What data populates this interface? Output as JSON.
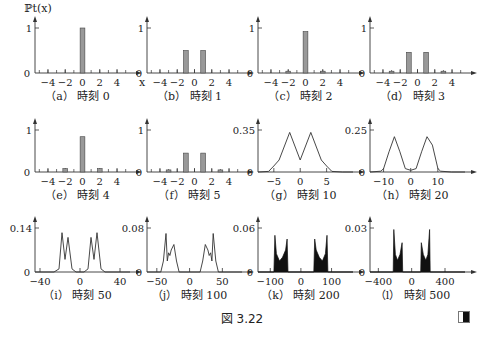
{
  "figure": {
    "label": "図 3.22",
    "y_axis_label": "ℙt(x)",
    "x_axis_label": "x"
  },
  "chart_data": [
    {
      "id": "a",
      "type": "bar",
      "caption": "（a） 時刻 0",
      "time": 0,
      "xlim": [
        -5.5,
        5.5
      ],
      "ylim": [
        0,
        1
      ],
      "yticks": [
        "0",
        "1"
      ],
      "xticks": [
        -4,
        -2,
        0,
        2,
        4
      ],
      "x": [
        -4,
        -3,
        -2,
        -1,
        0,
        1,
        2,
        3,
        4
      ],
      "values": [
        0,
        0,
        0,
        0,
        1,
        0,
        0,
        0,
        0
      ]
    },
    {
      "id": "b",
      "type": "bar",
      "caption": "（b） 時刻 1",
      "time": 1,
      "xlim": [
        -5.5,
        5.5
      ],
      "ylim": [
        0,
        1
      ],
      "yticks": [
        "0",
        "1"
      ],
      "xticks": [
        -4,
        -2,
        0,
        2,
        4
      ],
      "x": [
        -4,
        -3,
        -2,
        -1,
        0,
        1,
        2,
        3,
        4
      ],
      "values": [
        0,
        0,
        0,
        0.5,
        0,
        0.5,
        0,
        0,
        0
      ]
    },
    {
      "id": "c",
      "type": "bar",
      "caption": "（c） 時刻 2",
      "time": 2,
      "xlim": [
        -5.5,
        5.5
      ],
      "ylim": [
        0,
        1
      ],
      "yticks": [
        "0",
        "1"
      ],
      "xticks": [
        -4,
        -2,
        0,
        2,
        4
      ],
      "x": [
        -4,
        -3,
        -2,
        -1,
        0,
        1,
        2,
        3,
        4
      ],
      "values": [
        0,
        0,
        0.04,
        0,
        0.92,
        0,
        0.04,
        0,
        0
      ]
    },
    {
      "id": "d",
      "type": "bar",
      "caption": "（d） 時刻 3",
      "time": 3,
      "xlim": [
        -5.5,
        5.5
      ],
      "ylim": [
        0,
        1
      ],
      "yticks": [
        "0",
        "1"
      ],
      "xticks": [
        -4,
        -2,
        0,
        2,
        4
      ],
      "x": [
        -4,
        -3,
        -2,
        -1,
        0,
        1,
        2,
        3,
        4
      ],
      "values": [
        0,
        0.04,
        0,
        0.46,
        0,
        0.46,
        0,
        0.04,
        0
      ]
    },
    {
      "id": "e",
      "type": "bar",
      "caption": "（e） 時刻 4",
      "time": 4,
      "xlim": [
        -5.5,
        5.5
      ],
      "ylim": [
        0,
        1
      ],
      "yticks": [
        "0",
        "1"
      ],
      "xticks": [
        -4,
        -2,
        0,
        2,
        4
      ],
      "x": [
        -4,
        -3,
        -2,
        -1,
        0,
        1,
        2,
        3,
        4
      ],
      "values": [
        0,
        0,
        0.08,
        0,
        0.84,
        0,
        0.08,
        0,
        0
      ]
    },
    {
      "id": "f",
      "type": "bar",
      "caption": "（f） 時刻 5",
      "time": 5,
      "xlim": [
        -5.5,
        5.5
      ],
      "ylim": [
        0,
        1
      ],
      "yticks": [
        "0",
        "1"
      ],
      "xticks": [
        -4,
        -2,
        0,
        2,
        4
      ],
      "x": [
        -4,
        -3,
        -2,
        -1,
        0,
        1,
        2,
        3,
        4
      ],
      "values": [
        0,
        0.05,
        0,
        0.45,
        0,
        0.45,
        0,
        0.05,
        0
      ]
    },
    {
      "id": "g",
      "type": "line",
      "caption": "（g） 時刻 10",
      "time": 10,
      "xlim": [
        -8,
        10
      ],
      "ylim": [
        0,
        0.35
      ],
      "yticks": [
        "0",
        "0.35"
      ],
      "xticks": [
        -5,
        0,
        5
      ],
      "x": [
        -8,
        -6,
        -5,
        -4,
        -2,
        0,
        2,
        4,
        5,
        6,
        8,
        10
      ],
      "values": [
        0,
        0.005,
        0.05,
        0.1,
        0.33,
        0.1,
        0.33,
        0.1,
        0.05,
        0.005,
        0,
        0
      ]
    },
    {
      "id": "h",
      "type": "line",
      "caption": "（h） 時刻 20",
      "time": 20,
      "xlim": [
        -15,
        20
      ],
      "ylim": [
        0,
        0.25
      ],
      "yticks": [
        "0",
        "0.25"
      ],
      "xticks": [
        -10,
        0,
        10
      ],
      "x": [
        -15,
        -11,
        -10,
        -8,
        -6,
        -4,
        -2,
        0,
        2,
        4,
        6,
        8,
        10,
        11,
        15,
        20
      ],
      "values": [
        0,
        0.005,
        0.02,
        0.12,
        0.21,
        0.12,
        0.02,
        0.01,
        0.02,
        0.12,
        0.21,
        0.16,
        0.02,
        0.005,
        0,
        0
      ]
    },
    {
      "id": "i",
      "type": "line",
      "caption": "（i） 時刻 50",
      "time": 50,
      "xlim": [
        -45,
        50
      ],
      "ylim": [
        0,
        0.14
      ],
      "yticks": [
        "0",
        "0.14"
      ],
      "xticks": [
        -40,
        0,
        40
      ],
      "x": [
        -45,
        -26,
        -21,
        -18,
        -15,
        -12,
        -8,
        -4,
        0,
        4,
        8,
        11,
        14,
        17,
        21,
        25,
        50
      ],
      "values": [
        0,
        0,
        0.01,
        0.125,
        0.04,
        0.11,
        0.01,
        0,
        0,
        0,
        0.01,
        0.11,
        0.04,
        0.125,
        0.01,
        0,
        0
      ]
    },
    {
      "id": "j",
      "type": "line",
      "caption": "（j） 時刻 100",
      "time": 100,
      "xlim": [
        -65,
        80
      ],
      "ylim": [
        0,
        0.08
      ],
      "yticks": [
        "0",
        "0.08"
      ],
      "xticks": [
        -50,
        0,
        50
      ],
      "x": [
        -65,
        -44,
        -40,
        -36,
        -34,
        -32,
        -30,
        -28,
        -24,
        -20,
        -16,
        0,
        16,
        20,
        24,
        28,
        30,
        32,
        34,
        36,
        40,
        44,
        80
      ],
      "values": [
        0,
        0,
        0.02,
        0.07,
        0.02,
        0.035,
        0.03,
        0.04,
        0.05,
        0.02,
        0,
        0,
        0,
        0.02,
        0.05,
        0.04,
        0.03,
        0.035,
        0.02,
        0.07,
        0.02,
        0,
        0
      ]
    },
    {
      "id": "k",
      "type": "area",
      "caption": "（k） 時刻 200",
      "time": 200,
      "xlim": [
        -140,
        170
      ],
      "ylim": [
        0,
        0.06
      ],
      "yticks": [
        "0",
        "0.06"
      ],
      "xticks": [
        -100,
        0,
        100
      ],
      "x": [
        -140,
        -88,
        -85,
        -80,
        -70,
        -60,
        -50,
        -45,
        -42,
        0,
        42,
        45,
        50,
        60,
        70,
        80,
        85,
        88,
        170
      ],
      "values": [
        0,
        0,
        0.05,
        0.025,
        0.015,
        0.02,
        0.03,
        0.045,
        0,
        0,
        0,
        0.045,
        0.03,
        0.02,
        0.015,
        0.025,
        0.05,
        0,
        0
      ]
    },
    {
      "id": "l",
      "type": "area",
      "caption": "（l） 時刻 500",
      "time": 500,
      "xlim": [
        -500,
        640
      ],
      "ylim": [
        0,
        0.03
      ],
      "yticks": [
        "0",
        "0.03"
      ],
      "xticks": [
        -400,
        0,
        400
      ],
      "x": [
        -500,
        -222,
        -215,
        -195,
        -170,
        -140,
        -115,
        -108,
        0,
        108,
        115,
        140,
        170,
        195,
        215,
        222,
        640
      ],
      "values": [
        0,
        0,
        0.029,
        0.012,
        0.008,
        0.012,
        0.02,
        0,
        0,
        0,
        0.02,
        0.012,
        0.008,
        0.012,
        0.029,
        0,
        0
      ]
    }
  ]
}
